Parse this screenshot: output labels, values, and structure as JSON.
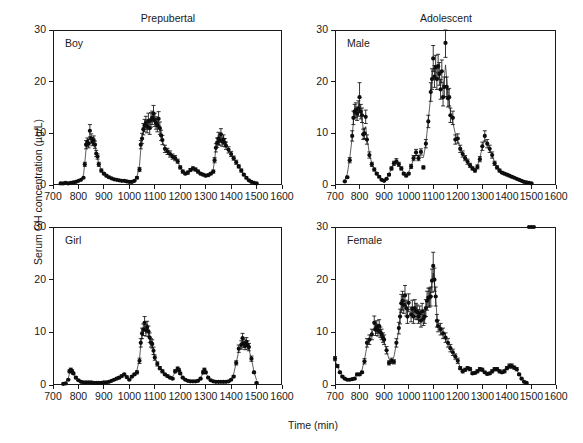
{
  "figure": {
    "axis_labels": {
      "x": "Time (min)",
      "y": "Serum GH concentration (µg/L)"
    },
    "column_titles": [
      "Prepubertal",
      "Adolescent"
    ],
    "xticks": [
      "700",
      "800",
      "900",
      "1000",
      "1100",
      "1200",
      "1300",
      "1400",
      "1500",
      "1600"
    ],
    "yticks": [
      "0",
      "10",
      "20",
      "30"
    ],
    "panel_labels": [
      "Boy",
      "Male",
      "Girl",
      "Female"
    ],
    "colors": {
      "marker": "#0d0d0d",
      "line": "#2a2a2a",
      "frame": "#1a1a1a",
      "background": "#ffffff"
    }
  },
  "chart_data": [
    {
      "type": "line",
      "title": "Prepubertal",
      "panel_label": "Boy",
      "xlabel": "Time (min)",
      "ylabel": "Serum GH concentration (µg/L)",
      "xlim": [
        700,
        1600
      ],
      "ylim": [
        0,
        30
      ],
      "grid": false,
      "legend": "none",
      "x": [
        730,
        740,
        750,
        760,
        770,
        780,
        790,
        800,
        810,
        820,
        825,
        830,
        835,
        840,
        845,
        850,
        855,
        860,
        865,
        870,
        875,
        880,
        890,
        900,
        910,
        920,
        930,
        940,
        950,
        960,
        970,
        980,
        990,
        1000,
        1010,
        1020,
        1030,
        1040,
        1045,
        1050,
        1055,
        1060,
        1065,
        1070,
        1075,
        1080,
        1085,
        1090,
        1095,
        1100,
        1105,
        1110,
        1115,
        1120,
        1125,
        1130,
        1140,
        1150,
        1160,
        1170,
        1180,
        1190,
        1200,
        1210,
        1220,
        1230,
        1240,
        1250,
        1260,
        1270,
        1280,
        1290,
        1300,
        1310,
        1320,
        1330,
        1335,
        1340,
        1345,
        1350,
        1355,
        1360,
        1365,
        1370,
        1375,
        1380,
        1390,
        1400,
        1410,
        1420,
        1430,
        1440,
        1450,
        1460,
        1470,
        1480,
        1490,
        1500
      ],
      "y": [
        0.3,
        0.3,
        0.4,
        0.3,
        0.4,
        0.5,
        0.6,
        0.8,
        1.0,
        1.4,
        4.0,
        7.8,
        8.3,
        8.0,
        10.5,
        9.0,
        8.4,
        8.7,
        7.8,
        6.1,
        5.5,
        4.0,
        2.8,
        2.2,
        1.8,
        1.5,
        1.3,
        1.1,
        1.0,
        0.9,
        0.8,
        0.8,
        0.7,
        0.6,
        0.6,
        0.8,
        1.4,
        3.0,
        7.8,
        9.0,
        10.8,
        11.5,
        12.0,
        11.3,
        12.4,
        11.0,
        12.6,
        13.0,
        13.8,
        12.6,
        12.0,
        11.5,
        12.8,
        11.0,
        9.6,
        8.7,
        7.0,
        6.5,
        6.0,
        5.5,
        5.2,
        4.6,
        3.4,
        2.6,
        2.2,
        2.4,
        2.9,
        3.2,
        3.0,
        2.6,
        2.2,
        2.0,
        1.8,
        1.9,
        2.2,
        2.6,
        4.8,
        7.2,
        8.2,
        9.0,
        8.6,
        9.8,
        8.4,
        8.8,
        8.2,
        7.6,
        6.8,
        6.0,
        5.2,
        4.4,
        3.6,
        2.8,
        2.0,
        1.4,
        0.9,
        0.6,
        0.4,
        0.3
      ],
      "yerr": [
        0,
        0,
        0,
        0,
        0,
        0,
        0,
        0,
        0,
        0,
        0.4,
        0.8,
        0.8,
        0.8,
        1.2,
        0.9,
        0.8,
        0.8,
        0.7,
        0.6,
        0.5,
        0.4,
        0.3,
        0.2,
        0.2,
        0.2,
        0.1,
        0.1,
        0.1,
        0.1,
        0.1,
        0.1,
        0.1,
        0.1,
        0.1,
        0.1,
        0.2,
        0.4,
        0.8,
        1.0,
        1.1,
        1.2,
        1.3,
        1.2,
        1.5,
        1.2,
        1.4,
        1.3,
        1.6,
        1.3,
        1.2,
        1.2,
        1.4,
        1.2,
        1.0,
        0.9,
        0.7,
        0.6,
        0.6,
        0.5,
        0.5,
        0.4,
        0.3,
        0.3,
        0.2,
        0.3,
        0.3,
        0.3,
        0.3,
        0.3,
        0.2,
        0.2,
        0.2,
        0.2,
        0.2,
        0.3,
        0.5,
        0.8,
        0.9,
        1.2,
        0.9,
        1.1,
        0.9,
        0.9,
        0.8,
        0.7,
        0.6,
        0.5,
        0.4,
        0.4,
        0.3,
        0.3,
        0.2,
        0.2,
        0.1,
        0.1,
        0.1,
        0.1
      ]
    },
    {
      "type": "line",
      "title": "Adolescent",
      "panel_label": "Male",
      "xlabel": "Time (min)",
      "ylabel": "Serum GH concentration (µg/L)",
      "xlim": [
        700,
        1600
      ],
      "ylim": [
        0,
        30
      ],
      "grid": false,
      "legend": "none",
      "x": [
        740,
        750,
        760,
        770,
        775,
        780,
        785,
        790,
        795,
        800,
        805,
        810,
        815,
        820,
        825,
        830,
        840,
        850,
        860,
        870,
        880,
        890,
        900,
        910,
        920,
        930,
        940,
        950,
        960,
        970,
        980,
        990,
        1000,
        1010,
        1020,
        1030,
        1040,
        1050,
        1060,
        1070,
        1080,
        1090,
        1095,
        1100,
        1105,
        1110,
        1115,
        1120,
        1125,
        1130,
        1135,
        1140,
        1145,
        1150,
        1155,
        1160,
        1165,
        1170,
        1180,
        1190,
        1200,
        1210,
        1220,
        1230,
        1240,
        1250,
        1260,
        1270,
        1280,
        1290,
        1300,
        1310,
        1320,
        1330,
        1340,
        1350,
        1360,
        1370,
        1380,
        1390,
        1400,
        1410,
        1420,
        1430,
        1440,
        1450,
        1460,
        1470,
        1480,
        1490,
        1500
      ],
      "y": [
        0.7,
        1.5,
        4.8,
        9.5,
        13.0,
        14.2,
        14.5,
        13.8,
        14.8,
        17.0,
        14.2,
        13.5,
        9.8,
        10.0,
        13.2,
        8.8,
        5.8,
        4.0,
        3.0,
        2.2,
        1.6,
        1.0,
        0.8,
        1.2,
        2.0,
        3.2,
        4.2,
        4.6,
        4.0,
        3.2,
        2.2,
        1.8,
        2.2,
        3.6,
        5.2,
        6.3,
        5.2,
        6.4,
        3.4,
        8.0,
        12.3,
        18.0,
        20.5,
        24.5,
        21.0,
        22.8,
        20.5,
        23.0,
        21.5,
        18.5,
        22.0,
        17.0,
        19.0,
        27.5,
        19.0,
        16.8,
        17.0,
        13.5,
        13.0,
        8.8,
        9.0,
        7.0,
        6.0,
        5.2,
        4.5,
        3.8,
        3.2,
        2.8,
        3.5,
        5.0,
        7.5,
        9.5,
        8.0,
        7.0,
        5.8,
        4.2,
        3.4,
        2.8,
        2.4,
        2.2,
        2.0,
        1.8,
        1.6,
        1.4,
        1.2,
        1.0,
        0.8,
        0.6,
        0.5,
        0.4,
        0.3
      ],
      "yerr": [
        0.1,
        0.2,
        0.5,
        1.0,
        1.3,
        1.4,
        1.4,
        1.3,
        1.5,
        2.8,
        1.4,
        1.4,
        1.0,
        1.0,
        1.3,
        0.9,
        0.6,
        0.4,
        0.3,
        0.2,
        0.2,
        0.1,
        0.1,
        0.1,
        0.2,
        0.3,
        0.4,
        0.5,
        0.4,
        0.3,
        0.2,
        0.2,
        0.2,
        0.4,
        0.5,
        0.6,
        0.5,
        0.6,
        0.3,
        0.8,
        1.2,
        1.8,
        2.0,
        2.5,
        2.1,
        2.3,
        2.0,
        2.3,
        2.2,
        1.9,
        2.2,
        1.7,
        1.9,
        2.8,
        1.9,
        1.7,
        1.7,
        1.4,
        1.3,
        0.9,
        0.9,
        0.7,
        0.6,
        0.5,
        0.5,
        0.4,
        0.3,
        0.3,
        0.4,
        0.5,
        0.8,
        1.0,
        0.8,
        0.7,
        0.6,
        0.4,
        0.3,
        0.3,
        0.2,
        0.2,
        0.2,
        0.2,
        0.2,
        0.1,
        0.1,
        0.1,
        0.1,
        0.1,
        0.1,
        0.1,
        0.1
      ]
    },
    {
      "type": "line",
      "title": "",
      "panel_label": "Girl",
      "xlabel": "Time (min)",
      "ylabel": "Serum GH concentration (µg/L)",
      "xlim": [
        700,
        1600
      ],
      "ylim": [
        0,
        30
      ],
      "grid": false,
      "legend": "none",
      "x": [
        740,
        750,
        760,
        765,
        770,
        775,
        780,
        790,
        800,
        810,
        820,
        830,
        840,
        850,
        860,
        870,
        880,
        890,
        900,
        910,
        920,
        930,
        940,
        950,
        960,
        970,
        980,
        990,
        1000,
        1010,
        1020,
        1030,
        1040,
        1045,
        1050,
        1055,
        1060,
        1065,
        1070,
        1075,
        1080,
        1085,
        1090,
        1095,
        1100,
        1110,
        1120,
        1130,
        1140,
        1150,
        1160,
        1170,
        1180,
        1190,
        1195,
        1200,
        1210,
        1220,
        1230,
        1240,
        1250,
        1260,
        1270,
        1280,
        1290,
        1295,
        1300,
        1310,
        1320,
        1330,
        1340,
        1350,
        1360,
        1370,
        1380,
        1390,
        1400,
        1410,
        1420,
        1430,
        1440,
        1445,
        1450,
        1455,
        1460,
        1465,
        1470,
        1480,
        1490,
        1500
      ],
      "y": [
        0.2,
        0.3,
        1.0,
        2.6,
        2.9,
        2.6,
        2.2,
        1.4,
        0.9,
        0.6,
        0.5,
        0.5,
        0.5,
        0.5,
        0.4,
        0.4,
        0.4,
        0.4,
        0.5,
        0.5,
        0.6,
        0.8,
        1.0,
        1.2,
        1.4,
        1.7,
        2.0,
        1.5,
        1.0,
        1.6,
        2.0,
        2.4,
        4.6,
        8.0,
        9.8,
        10.5,
        11.8,
        10.4,
        11.0,
        10.2,
        9.0,
        8.0,
        7.8,
        6.5,
        5.2,
        4.0,
        3.2,
        2.6,
        2.0,
        1.7,
        1.4,
        1.2,
        2.6,
        3.1,
        2.8,
        2.2,
        1.4,
        1.0,
        0.8,
        0.7,
        0.7,
        0.7,
        0.8,
        1.2,
        2.4,
        2.9,
        2.4,
        1.4,
        0.9,
        0.7,
        0.6,
        0.6,
        0.6,
        0.6,
        0.6,
        0.7,
        1.0,
        1.6,
        4.2,
        6.9,
        7.6,
        8.9,
        7.9,
        7.4,
        8.2,
        7.6,
        7.2,
        5.0,
        2.4,
        0.4
      ],
      "yerr": [
        0,
        0,
        0.1,
        0.3,
        0.3,
        0.3,
        0.2,
        0.2,
        0.1,
        0.1,
        0.1,
        0.1,
        0.1,
        0.1,
        0,
        0,
        0,
        0,
        0,
        0,
        0.1,
        0.1,
        0.1,
        0.1,
        0.2,
        0.2,
        0.2,
        0.2,
        0.1,
        0.2,
        0.2,
        0.3,
        0.5,
        0.8,
        1.0,
        1.1,
        1.2,
        1.1,
        1.1,
        1.0,
        0.9,
        0.8,
        0.8,
        0.7,
        0.5,
        0.4,
        0.3,
        0.3,
        0.2,
        0.2,
        0.1,
        0.1,
        0.3,
        0.3,
        0.3,
        0.2,
        0.1,
        0.1,
        0.1,
        0.1,
        0.1,
        0.1,
        0.1,
        0.1,
        0.3,
        0.3,
        0.2,
        0.1,
        0.1,
        0.1,
        0.1,
        0.1,
        0.1,
        0.1,
        0.1,
        0.1,
        0.1,
        0.2,
        0.4,
        0.7,
        0.8,
        0.9,
        0.8,
        0.7,
        0.8,
        0.8,
        0.7,
        0.5,
        0.2,
        0.1
      ]
    },
    {
      "type": "line",
      "title": "",
      "panel_label": "Female",
      "xlabel": "Time (min)",
      "ylabel": "Serum GH concentration (µg/L)",
      "xlim": [
        700,
        1600
      ],
      "ylim": [
        0,
        30
      ],
      "grid": false,
      "legend": "none",
      "x": [
        700,
        710,
        720,
        730,
        740,
        750,
        760,
        770,
        780,
        790,
        800,
        810,
        820,
        830,
        840,
        850,
        860,
        865,
        870,
        875,
        880,
        885,
        890,
        895,
        900,
        910,
        920,
        930,
        940,
        950,
        960,
        965,
        970,
        975,
        980,
        985,
        990,
        995,
        1000,
        1010,
        1015,
        1020,
        1025,
        1030,
        1035,
        1040,
        1045,
        1050,
        1055,
        1060,
        1065,
        1070,
        1075,
        1080,
        1085,
        1090,
        1095,
        1100,
        1105,
        1110,
        1115,
        1120,
        1130,
        1140,
        1150,
        1160,
        1170,
        1180,
        1190,
        1200,
        1210,
        1220,
        1230,
        1240,
        1250,
        1260,
        1270,
        1280,
        1290,
        1300,
        1310,
        1320,
        1330,
        1340,
        1350,
        1360,
        1370,
        1380,
        1390,
        1400,
        1410,
        1420,
        1430,
        1440,
        1450,
        1460,
        1470,
        1480,
        1490,
        1500,
        1510
      ],
      "y": [
        5.0,
        3.6,
        2.4,
        1.6,
        1.2,
        1.0,
        1.0,
        1.1,
        1.2,
        2.0,
        2.0,
        2.4,
        4.5,
        8.0,
        8.6,
        9.6,
        11.8,
        10.5,
        11.0,
        10.4,
        11.2,
        10.0,
        9.6,
        9.0,
        8.6,
        6.6,
        4.2,
        4.6,
        4.4,
        8.0,
        10.8,
        13.0,
        15.5,
        16.0,
        15.2,
        17.0,
        14.6,
        13.0,
        15.6,
        13.4,
        14.5,
        13.0,
        14.6,
        14.0,
        13.8,
        13.0,
        13.6,
        12.2,
        14.0,
        12.6,
        13.0,
        14.6,
        16.0,
        16.6,
        16.6,
        16.8,
        19.8,
        22.6,
        20.0,
        16.8,
        12.2,
        11.2,
        10.6,
        9.8,
        9.0,
        8.0,
        7.0,
        6.2,
        5.4,
        4.6,
        3.2,
        2.6,
        2.9,
        3.2,
        3.0,
        2.2,
        2.3,
        2.6,
        3.0,
        2.9,
        2.4,
        2.1,
        2.2,
        2.6,
        3.0,
        3.0,
        2.6,
        2.4,
        2.6,
        3.2,
        3.6,
        3.6,
        3.3,
        3.0,
        2.0,
        1.2,
        0.6,
        0.4
      ],
      "yerr": [
        0.4,
        0.3,
        0.2,
        0.2,
        0.1,
        0.1,
        0.1,
        0.1,
        0.1,
        0.2,
        0.2,
        0.2,
        0.5,
        0.8,
        0.9,
        1.0,
        1.3,
        1.1,
        1.2,
        1.1,
        1.2,
        1.0,
        1.0,
        0.9,
        0.9,
        0.7,
        0.4,
        0.5,
        0.4,
        0.8,
        1.1,
        1.4,
        1.7,
        1.8,
        1.6,
        1.9,
        1.5,
        1.3,
        1.7,
        1.4,
        1.6,
        1.3,
        1.6,
        1.5,
        1.4,
        1.3,
        1.4,
        1.2,
        1.5,
        1.3,
        1.3,
        1.6,
        1.8,
        1.8,
        1.8,
        1.8,
        2.2,
        2.6,
        2.2,
        1.8,
        1.2,
        1.1,
        1.1,
        1.0,
        0.9,
        0.8,
        0.7,
        0.6,
        0.5,
        0.5,
        0.3,
        0.3,
        0.3,
        0.3,
        0.3,
        0.2,
        0.2,
        0.3,
        0.3,
        0.3,
        0.2,
        0.2,
        0.2,
        0.3,
        0.3,
        0.3,
        0.3,
        0.2,
        0.3,
        0.3,
        0.4,
        0.4,
        0.3,
        0.3,
        0.2,
        0.1,
        0.1,
        0.1
      ]
    }
  ]
}
